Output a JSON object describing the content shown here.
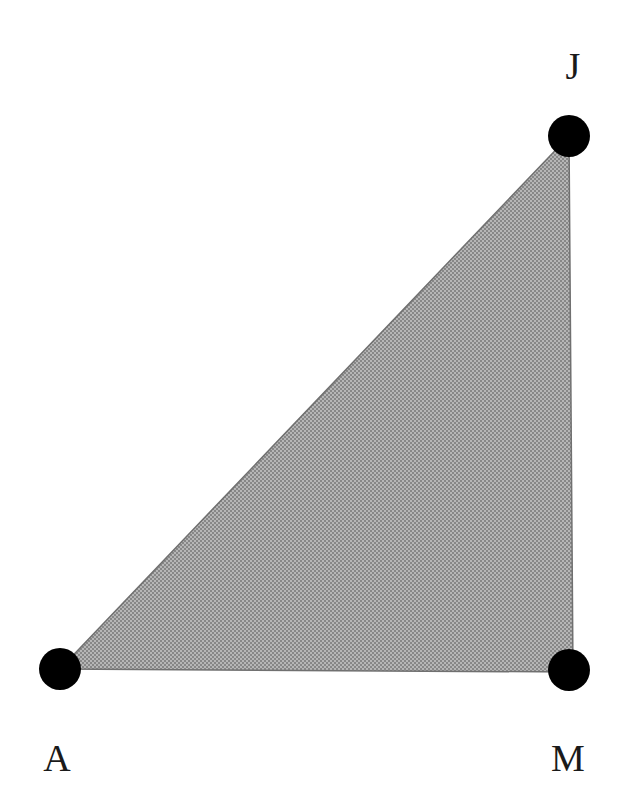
{
  "figure": {
    "type": "geometric-diagram",
    "shape": "triangle",
    "background_color": "#ffffff",
    "canvas": {
      "width": 621,
      "height": 808
    }
  },
  "style": {
    "fill_color": "#a0a0a0",
    "fill_pattern": "halftone-dither-50-percent",
    "fill_pattern_light": "#b4b4b4",
    "fill_pattern_dark": "#8a8a8a",
    "edge_color": "#707070",
    "edge_width": 1.5,
    "vertex_dot_color": "#000000",
    "vertex_dot_radius": 21,
    "label_color": "#1a1a1a",
    "label_font_size": 38
  },
  "chart_data": {
    "type": "scatter",
    "title": "",
    "xlabel": "",
    "ylabel": "",
    "grid": false,
    "legend": "none",
    "annotations": [
      "A",
      "J",
      "M"
    ],
    "vertices": [
      {
        "label": "A",
        "x": 60,
        "y": 669,
        "label_x": 57,
        "label_y": 758,
        "label_position": "below"
      },
      {
        "label": "J",
        "x": 569,
        "y": 136,
        "label_x": 573,
        "label_y": 66,
        "label_position": "above"
      },
      {
        "label": "M",
        "x": 569,
        "y": 670,
        "label_x": 568,
        "label_y": 758,
        "label_position": "below"
      }
    ],
    "polygon": "60,669 569,136 573,672",
    "edges": [
      {
        "from": "A",
        "to": "J",
        "name": "hypotenuse"
      },
      {
        "from": "J",
        "to": "M",
        "name": "vertical-leg"
      },
      {
        "from": "M",
        "to": "A",
        "name": "horizontal-leg"
      }
    ]
  },
  "labels": {
    "a": "A",
    "j": "J",
    "m": "M"
  }
}
